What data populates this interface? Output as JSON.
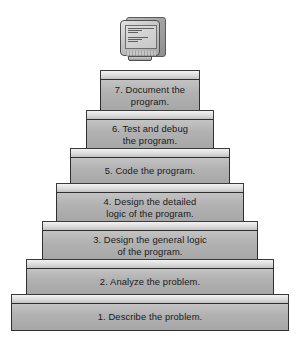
{
  "diagram": {
    "colors": {
      "background": "#ffffff",
      "step_face": "#b2b2b2",
      "step_top": "#dcdcdc",
      "outline": "#2f2f2f",
      "text": "#1a1a1a"
    },
    "monitor": {
      "name": "computer-monitor",
      "screen_lines": [
        "",
        "",
        "",
        "",
        "",
        "",
        ""
      ]
    },
    "steps": [
      {
        "number": "7",
        "label": "7. Document the\nprogram."
      },
      {
        "number": "6",
        "label": "6. Test and debug\nthe program."
      },
      {
        "number": "5",
        "label": "5. Code the program."
      },
      {
        "number": "4",
        "label": "4. Design the detailed\nlogic of the program."
      },
      {
        "number": "3",
        "label": "3. Design the general logic\nof the program."
      },
      {
        "number": "2",
        "label": "2. Analyze the problem."
      },
      {
        "number": "1",
        "label": "1. Describe the problem."
      }
    ]
  }
}
